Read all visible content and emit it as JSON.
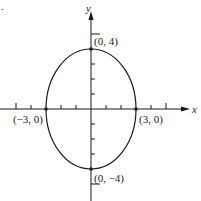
{
  "figure": {
    "type": "ellipse-graph",
    "equation_implied": "x^2/9 + y^2/16 = 1",
    "axes": {
      "x_label": "x",
      "y_label": "y"
    },
    "points": [
      {
        "label": "(0, 4)",
        "x": 0,
        "y": 4
      },
      {
        "label": "(−3, 0)",
        "x": -3,
        "y": 0
      },
      {
        "label": "(3, 0)",
        "x": 3,
        "y": 0
      },
      {
        "label": "(0, −4)",
        "x": 0,
        "y": -4
      }
    ],
    "x_range": [
      -6,
      6
    ],
    "y_range": [
      -6,
      6
    ],
    "colors": {
      "stroke": "#1a1a1a",
      "background": "#ffffff"
    }
  }
}
